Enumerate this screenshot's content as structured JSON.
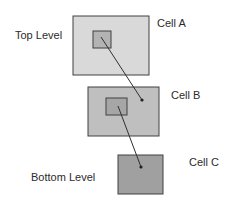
{
  "labels": {
    "top_level": "Top Level",
    "bottom_level": "Bottom Level",
    "cell_a": "Cell A",
    "cell_b": "Cell B",
    "cell_c": "Cell C"
  },
  "colors": {
    "cell_a_fill": "#d9d9d9",
    "cell_a_inner_fill": "#b3b3b3",
    "cell_b_fill": "#bfbfbf",
    "cell_b_inner_fill": "#a6a6a6",
    "cell_c_fill": "#a0a0a0",
    "stroke": "#404040"
  }
}
